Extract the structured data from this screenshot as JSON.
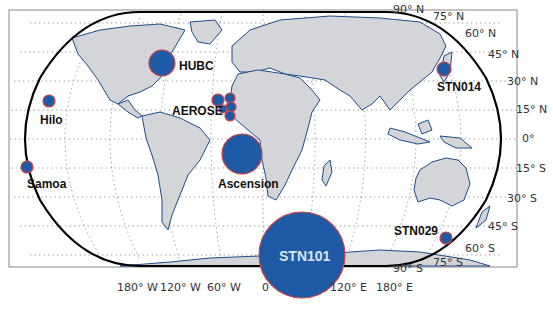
{
  "figure": {
    "type": "world-map",
    "projection": "Robinson-like (rounded rectangle)",
    "colors": {
      "ocean": "#ffffff",
      "land": "#d3d5d8",
      "coastline": "#1e4b8a",
      "marker_fill": "#1f5aa6",
      "marker_edge": "#d04040",
      "graticule": "#8a8a8a",
      "frame": "#888888",
      "outline": "#000000"
    }
  },
  "lat_labels": [
    "90° N",
    "75° N",
    "60° N",
    "45° N",
    "30° N",
    "15° N",
    "0°",
    "15° S",
    "30° S",
    "45° S",
    "60° S",
    "75° S",
    "90° S"
  ],
  "lon_labels": [
    "180° W",
    "120° W",
    "60° W",
    "0",
    "120° E",
    "180° E"
  ],
  "stations": [
    {
      "name": "HUBC",
      "label": "HUBC",
      "cx": 162,
      "cy": 63,
      "r": 13
    },
    {
      "name": "Hilo",
      "label": "Hilo",
      "cx": 49,
      "cy": 101,
      "r": 6
    },
    {
      "name": "Samoa",
      "label": "Samoa",
      "cx": 27,
      "cy": 167,
      "r": 6
    },
    {
      "name": "AEROSE",
      "label": "AEROSE",
      "cx": 225,
      "cy": 104,
      "r": 7
    },
    {
      "name": "Ascension",
      "label": "Ascension",
      "cx": 242,
      "cy": 154,
      "r": 20
    },
    {
      "name": "STN014",
      "label": "STN014",
      "cx": 444,
      "cy": 69,
      "r": 7
    },
    {
      "name": "STN029",
      "label": "STN029",
      "cx": 446,
      "cy": 238,
      "r": 6
    },
    {
      "name": "STN101",
      "label": "STN101",
      "cx": 302,
      "cy": 255,
      "r": 43
    }
  ],
  "aerose_cluster": [
    {
      "cx": 218,
      "cy": 100,
      "r": 6
    },
    {
      "cx": 230,
      "cy": 98,
      "r": 5
    },
    {
      "cx": 231,
      "cy": 107,
      "r": 5
    },
    {
      "cx": 223,
      "cy": 109,
      "r": 4
    },
    {
      "cx": 230,
      "cy": 116,
      "r": 5
    }
  ]
}
